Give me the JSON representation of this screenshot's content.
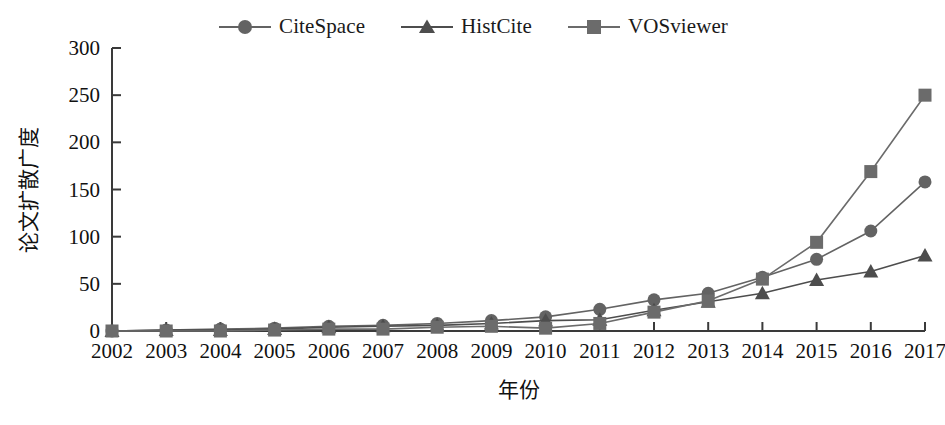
{
  "chart_data": {
    "type": "line",
    "title": "",
    "xlabel": "年份",
    "ylabel": "论文扩散广度",
    "categories": [
      "2002",
      "2003",
      "2004",
      "2005",
      "2006",
      "2007",
      "2008",
      "2009",
      "2010",
      "2011",
      "2012",
      "2013",
      "2014",
      "2015",
      "2016",
      "2017"
    ],
    "x": [
      2002,
      2003,
      2004,
      2005,
      2006,
      2007,
      2008,
      2009,
      2010,
      2011,
      2012,
      2013,
      2014,
      2015,
      2016,
      2017
    ],
    "ylim": [
      0,
      300
    ],
    "xlim": [
      2002,
      2017
    ],
    "yticks": [
      0,
      50,
      100,
      150,
      200,
      250,
      300
    ],
    "ytick_labels": [
      "0",
      "50",
      "100",
      "150",
      "200",
      "250",
      "300"
    ],
    "grid": false,
    "legend_position": "top-center",
    "series": [
      {
        "name": "CiteSpace",
        "marker": "circle",
        "color": "#636363",
        "values": [
          0,
          1,
          2,
          3,
          5,
          6,
          8,
          11,
          15,
          23,
          33,
          40,
          57,
          76,
          106,
          158
        ]
      },
      {
        "name": "HistCite",
        "marker": "triangle",
        "color": "#4d4d4d",
        "values": [
          0,
          1,
          1,
          2,
          4,
          5,
          6,
          8,
          11,
          12,
          22,
          31,
          40,
          54,
          63,
          80
        ]
      },
      {
        "name": "VOSviewer",
        "marker": "square",
        "color": "#6b6b6b",
        "values": [
          0,
          0,
          0,
          1,
          2,
          2,
          4,
          5,
          3,
          8,
          20,
          32,
          55,
          94,
          169,
          250
        ]
      }
    ]
  },
  "legend": {
    "items": [
      {
        "label": "CiteSpace",
        "marker": "circle"
      },
      {
        "label": "HistCite",
        "marker": "triangle"
      },
      {
        "label": "VOSviewer",
        "marker": "square"
      }
    ]
  },
  "axes": {
    "y_title": "论文扩散广度",
    "x_title": "年份"
  },
  "colors": {
    "series_1": "#636363",
    "series_2": "#4d4d4d",
    "series_3": "#6b6b6b",
    "axis": "#3a3a3a",
    "text": "#111111",
    "background": "#ffffff"
  }
}
